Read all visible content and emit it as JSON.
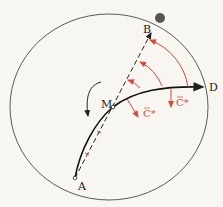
{
  "diagram": {
    "points": {
      "A": {
        "label": "A",
        "x": 75,
        "y": 178
      },
      "B": {
        "label": "B",
        "x": 152,
        "y": 30
      },
      "M": {
        "label": "M",
        "x": 113,
        "y": 107
      },
      "D": {
        "label": "D",
        "x": 205,
        "y": 86
      }
    },
    "force_labels": [
      {
        "text": "C*",
        "x": 143,
        "y": 115
      },
      {
        "text": "C*",
        "x": 176,
        "y": 104
      }
    ],
    "colors": {
      "background": "#f7f6f1",
      "ink": "#222222",
      "accent": "#e0453a",
      "ball": "#555555"
    },
    "rotation_direction": "counterclockwise-arrow"
  }
}
